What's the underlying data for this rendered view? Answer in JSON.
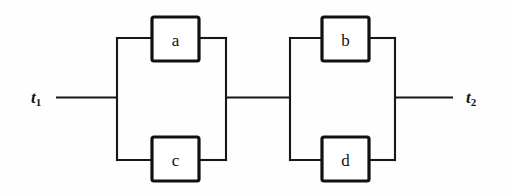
{
  "diagram": {
    "background_color": "#fefefe",
    "line_color": "#171717",
    "block_border_color": "#111111",
    "block_fill_color": "#ffffff",
    "terminals": {
      "input": {
        "label": "t",
        "subscript": "1"
      },
      "output": {
        "label": "t",
        "subscript": "2"
      }
    },
    "blocks": [
      {
        "id": "a",
        "label": "a",
        "x": 152,
        "y": 17,
        "width": 47,
        "height": 44
      },
      {
        "id": "b",
        "label": "b",
        "x": 322,
        "y": 17,
        "width": 47,
        "height": 44
      },
      {
        "id": "c",
        "label": "c",
        "x": 152,
        "y": 137,
        "width": 47,
        "height": 44
      },
      {
        "id": "d",
        "label": "d",
        "x": 322,
        "y": 137,
        "width": 47,
        "height": 44
      }
    ],
    "groups": [
      {
        "name": "parallel-group-left",
        "members": [
          "a",
          "c"
        ]
      },
      {
        "name": "parallel-group-right",
        "members": [
          "b",
          "d"
        ]
      }
    ]
  }
}
